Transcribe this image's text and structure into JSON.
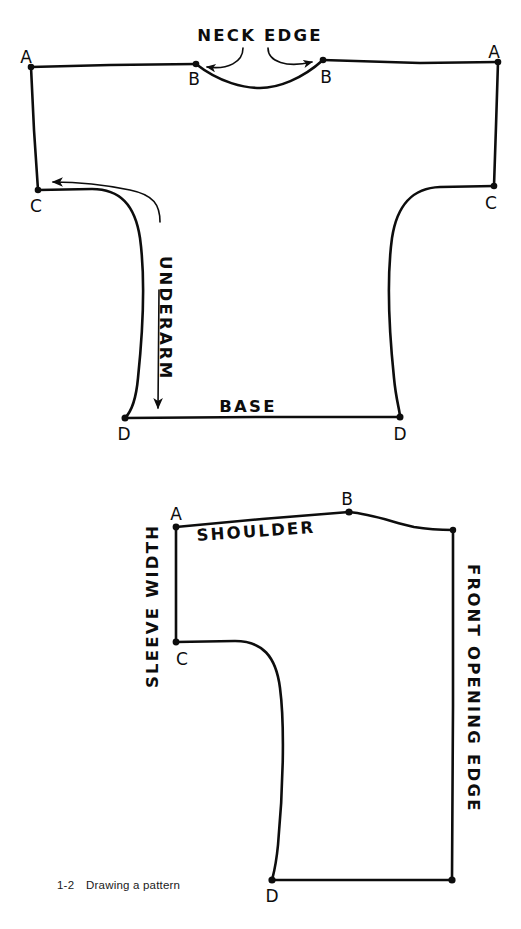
{
  "figure": {
    "caption_number": "1-2",
    "caption_text": "Drawing a pattern",
    "ink_color": "#0d0d0d",
    "background_color": "#ffffff"
  },
  "top_diagram": {
    "name": "kimono-body-pattern-front-and-back-opened-flat",
    "labels": {
      "neck_edge": "NECK EDGE",
      "underarm": "UNDERARM",
      "base": "BASE"
    },
    "points": [
      {
        "id": "A-left",
        "label": "A",
        "x": 31,
        "y": 67
      },
      {
        "id": "B-left",
        "label": "B",
        "x": 196,
        "y": 64
      },
      {
        "id": "B-right",
        "label": "B",
        "x": 323,
        "y": 60
      },
      {
        "id": "A-right",
        "label": "A",
        "x": 498,
        "y": 62
      },
      {
        "id": "C-left",
        "label": "C",
        "x": 38,
        "y": 190
      },
      {
        "id": "C-right",
        "label": "C",
        "x": 494,
        "y": 186
      },
      {
        "id": "D-left",
        "label": "D",
        "x": 125,
        "y": 418
      },
      {
        "id": "D-right",
        "label": "D",
        "x": 400,
        "y": 417
      }
    ]
  },
  "bottom_diagram": {
    "name": "kimono-half-pattern-front-piece",
    "labels": {
      "sleeve_width": "SLEEVE WIDTH",
      "shoulder": "SHOULDER",
      "front_opening_edge": "FRONT OPENING EDGE"
    },
    "points": [
      {
        "id": "A",
        "label": "A",
        "x": 176,
        "y": 527
      },
      {
        "id": "B",
        "label": "B",
        "x": 349,
        "y": 512
      },
      {
        "id": "C",
        "label": "C",
        "x": 176,
        "y": 642
      },
      {
        "id": "D",
        "label": "D",
        "x": 272,
        "y": 880
      }
    ]
  }
}
